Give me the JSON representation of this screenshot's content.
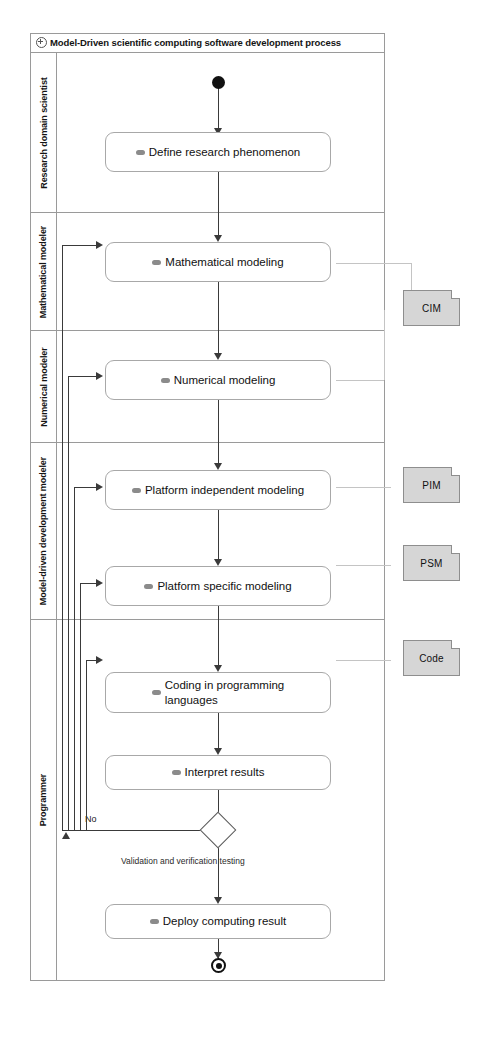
{
  "diagram": {
    "title": "Model-Driven scientific computing software development process",
    "title_icon": "activity-frame-icon",
    "type": "uml-activity-diagram"
  },
  "swimlanes": [
    {
      "id": "research-domain-scientist",
      "label": "Research domain scientist"
    },
    {
      "id": "mathematical-modeler",
      "label": "Mathematical modeler"
    },
    {
      "id": "numerical-modeler",
      "label": "Numerical modeler"
    },
    {
      "id": "model-driven-development-modeler",
      "label": "Model-driven development modeler"
    },
    {
      "id": "programmer",
      "label": "Programmer"
    }
  ],
  "nodes": {
    "initial": {
      "name": "initial-node",
      "label": ""
    },
    "final": {
      "name": "activity-final-node",
      "label": ""
    },
    "decision": {
      "name": "decision-node",
      "label": "Validation and verification testing"
    }
  },
  "actions": [
    {
      "id": "define-research-phenomenon",
      "label": "Define research phenomenon",
      "lane": "research-domain-scientist"
    },
    {
      "id": "mathematical-modeling",
      "label": "Mathematical modeling",
      "lane": "mathematical-modeler"
    },
    {
      "id": "numerical-modeling",
      "label": "Numerical modeling",
      "lane": "numerical-modeler"
    },
    {
      "id": "platform-independent-modeling",
      "label": "Platform independent modeling",
      "lane": "model-driven-development-modeler"
    },
    {
      "id": "platform-specific-modeling",
      "label": "Platform specific modeling",
      "lane": "model-driven-development-modeler"
    },
    {
      "id": "coding-in-programming-languages",
      "label_line1": "Coding in programming",
      "label_line2": "languages",
      "lane": "programmer"
    },
    {
      "id": "interpret-results",
      "label": "Interpret results",
      "lane": "programmer"
    },
    {
      "id": "deploy-computing-result",
      "label": "Deploy computing result",
      "lane": "programmer"
    }
  ],
  "edge_labels": {
    "no_branch": "No"
  },
  "artifacts": [
    {
      "id": "cim",
      "label": "CIM"
    },
    {
      "id": "pim",
      "label": "PIM"
    },
    {
      "id": "psm",
      "label": "PSM"
    },
    {
      "id": "code",
      "label": "Code"
    }
  ],
  "colors": {
    "frame_border": "#9a9a9a",
    "node_border": "#a8a8a8",
    "edge": "#3a3a3a",
    "artifact_fill": "#d6d6d6",
    "artifact_border": "#8e8e8e",
    "background": "#ffffff"
  }
}
